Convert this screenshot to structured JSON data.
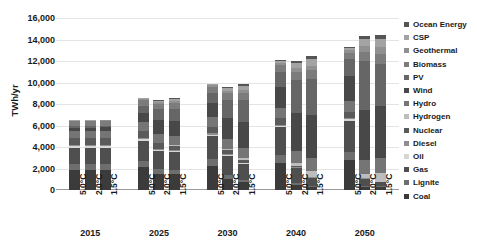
{
  "chart_data": {
    "type": "bar",
    "stacked": true,
    "title": "",
    "xlabel": "",
    "ylabel": "TWh/yr",
    "ylim": [
      0,
      16000
    ],
    "yticks": [
      "0",
      "2,000",
      "4,000",
      "6,000",
      "8,000",
      "10,000",
      "12,000",
      "14,000",
      "16,000"
    ],
    "ytick_values": [
      0,
      2000,
      4000,
      6000,
      8000,
      10000,
      12000,
      14000,
      16000
    ],
    "grid": true,
    "legend_position": "right",
    "groups": [
      "2015",
      "2025",
      "2030",
      "2040",
      "2050"
    ],
    "scenarios": [
      "5.0°C",
      "2.0°C",
      "1.5°C"
    ],
    "categories": [
      "2015 5.0°C",
      "2015 2.0°C",
      "2015 1.5°C",
      "2025 5.0°C",
      "2025 2.0°C",
      "2025 1.5°C",
      "2030 5.0°C",
      "2030 2.0°C",
      "2030 1.5°C",
      "2040 5.0°C",
      "2040 2.0°C",
      "2040 1.5°C",
      "2050 5.0°C",
      "2050 2.0°C",
      "2050 1.5°C"
    ],
    "totals": [
      6000,
      6000,
      6050,
      8200,
      7600,
      7600,
      9300,
      8700,
      8900,
      11700,
      11600,
      11600,
      12500,
      14000,
      13300
    ],
    "series": [
      {
        "name": "Coal",
        "color": "#3b3b3b",
        "values": [
          1900,
          1900,
          1900,
          2100,
          1500,
          1450,
          2250,
          1050,
          700,
          2550,
          500,
          250,
          2800,
          250,
          250
        ]
      },
      {
        "name": "Lignite",
        "color": "#6e6e6e",
        "values": [
          550,
          550,
          550,
          600,
          450,
          420,
          620,
          330,
          220,
          700,
          160,
          80,
          760,
          80,
          80
        ]
      },
      {
        "name": "Gas",
        "color": "#4f4f4f",
        "values": [
          1450,
          1450,
          1450,
          1900,
          1700,
          1650,
          2150,
          1800,
          1500,
          2600,
          1350,
          800,
          2900,
          700,
          420
        ]
      },
      {
        "name": "Oil",
        "color": "#d6d6d6",
        "values": [
          160,
          160,
          160,
          150,
          120,
          110,
          140,
          90,
          70,
          130,
          50,
          30,
          120,
          25,
          20
        ]
      },
      {
        "name": "Diesel",
        "color": "#8e8e8e",
        "values": [
          100,
          100,
          100,
          110,
          90,
          85,
          110,
          70,
          55,
          110,
          40,
          25,
          110,
          20,
          15
        ]
      },
      {
        "name": "Nuclear",
        "color": "#5a5a5a",
        "values": [
          640,
          640,
          640,
          650,
          520,
          430,
          640,
          400,
          250,
          600,
          160,
          60,
          560,
          40,
          0
        ]
      },
      {
        "name": "Hydrogen",
        "color": "#bdbdbd",
        "values": [
          0,
          0,
          0,
          0,
          40,
          60,
          0,
          90,
          160,
          0,
          260,
          480,
          0,
          420,
          760
        ]
      },
      {
        "name": "Hydro",
        "color": "#757575",
        "values": [
          680,
          680,
          700,
          790,
          830,
          860,
          860,
          950,
          1000,
          980,
          1150,
          1250,
          1050,
          1300,
          1400
        ]
      },
      {
        "name": "Wind",
        "color": "#484848",
        "values": [
          300,
          300,
          320,
          900,
          1250,
          1380,
          1300,
          1950,
          2400,
          1900,
          3500,
          4050,
          2300,
          4600,
          4900
        ]
      },
      {
        "name": "PV",
        "color": "#666666",
        "values": [
          150,
          150,
          160,
          640,
          1000,
          1130,
          950,
          1650,
          2000,
          1450,
          3100,
          3350,
          1550,
          4550,
          3900
        ]
      },
      {
        "name": "Biomass",
        "color": "#7c7c7c",
        "values": [
          450,
          450,
          450,
          500,
          530,
          560,
          550,
          620,
          680,
          600,
          750,
          780,
          640,
          850,
          900
        ]
      },
      {
        "name": "Geothermal",
        "color": "#909090",
        "values": [
          90,
          90,
          90,
          130,
          160,
          180,
          160,
          220,
          280,
          220,
          360,
          420,
          260,
          560,
          620
        ]
      },
      {
        "name": "CSP",
        "color": "#a3a3a3",
        "values": [
          10,
          10,
          10,
          80,
          130,
          160,
          110,
          260,
          380,
          180,
          480,
          620,
          200,
          680,
          800
        ]
      },
      {
        "name": "Ocean Energy",
        "color": "#555555",
        "values": [
          0,
          0,
          0,
          30,
          50,
          60,
          40,
          110,
          180,
          60,
          180,
          270,
          90,
          250,
          380
        ]
      }
    ]
  },
  "legend": {
    "items": [
      {
        "label": "Ocean Energy",
        "color": "#555555"
      },
      {
        "label": "CSP",
        "color": "#a3a3a3"
      },
      {
        "label": "Geothermal",
        "color": "#909090"
      },
      {
        "label": "Biomass",
        "color": "#7c7c7c"
      },
      {
        "label": "PV",
        "color": "#666666"
      },
      {
        "label": "Wind",
        "color": "#484848"
      },
      {
        "label": "Hydro",
        "color": "#757575"
      },
      {
        "label": "Hydrogen",
        "color": "#bdbdbd"
      },
      {
        "label": "Nuclear",
        "color": "#5a5a5a"
      },
      {
        "label": "Diesel",
        "color": "#8e8e8e"
      },
      {
        "label": "Oil",
        "color": "#d6d6d6"
      },
      {
        "label": "Gas",
        "color": "#4f4f4f"
      },
      {
        "label": "Lignite",
        "color": "#6e6e6e"
      },
      {
        "label": "Coal",
        "color": "#3b3b3b"
      }
    ]
  },
  "axes": {
    "y_title": "TWh/yr"
  }
}
